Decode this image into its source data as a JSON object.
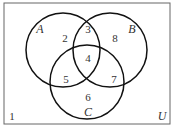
{
  "diagram": {
    "type": "venn",
    "universe_label": "U",
    "sets": [
      {
        "name": "A",
        "cx": 63,
        "cy": 50,
        "r": 37,
        "label_x": 40,
        "label_y": 33
      },
      {
        "name": "B",
        "cx": 110,
        "cy": 50,
        "r": 37,
        "label_x": 132,
        "label_y": 33
      },
      {
        "name": "C",
        "cx": 87,
        "cy": 82,
        "r": 37,
        "label_x": 88,
        "label_y": 116
      }
    ],
    "regions": [
      {
        "id": "outside",
        "value": "1",
        "x": 12,
        "y": 120
      },
      {
        "id": "A_only",
        "value": "2",
        "x": 65,
        "y": 42
      },
      {
        "id": "A_and_B_only",
        "value": "3",
        "x": 88,
        "y": 33
      },
      {
        "id": "A_B_C",
        "value": "4",
        "x": 88,
        "y": 62
      },
      {
        "id": "A_and_C_only",
        "value": "5",
        "x": 66,
        "y": 83
      },
      {
        "id": "C_only",
        "value": "6",
        "x": 88,
        "y": 101
      },
      {
        "id": "B_and_C_only",
        "value": "7",
        "x": 114,
        "y": 83
      },
      {
        "id": "B_only",
        "value": "8",
        "x": 115,
        "y": 42
      }
    ],
    "colors": {
      "stroke": "#111111",
      "text": "#333333",
      "frame": "#666666"
    }
  }
}
